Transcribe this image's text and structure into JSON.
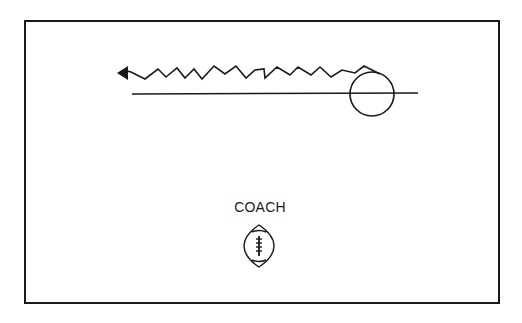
{
  "diagram": {
    "title": "",
    "labels": {
      "coach": "COACH"
    },
    "elements": {
      "player_circle": {
        "cx": 372,
        "cy": 94,
        "r": 22
      },
      "line_of_scrimmage": {
        "x1": 132,
        "y1": 94,
        "x2": 418,
        "y2": 93
      },
      "zigzag_route": {
        "direction": "left",
        "arrowhead": "filled-triangle"
      },
      "football_icon": {
        "cx": 259,
        "cy": 246
      }
    },
    "colors": {
      "stroke": "#1a1a1a",
      "background": "#ffffff"
    }
  }
}
